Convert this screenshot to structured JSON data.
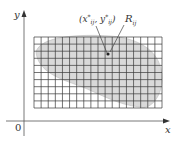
{
  "figure": {
    "type": "double-integral-partition",
    "axes": {
      "x_label": "x",
      "y_label": "y",
      "origin_label": "0"
    },
    "grid": {
      "columns": 18,
      "rows": 10
    },
    "annotations": {
      "sample_point": "(x*_ij, y*_ij)",
      "subrectangle": "R_ij"
    },
    "colors": {
      "region_fill": "#d9d9d9",
      "grid_line": "#3a3a3a",
      "axis": "#555555"
    }
  }
}
